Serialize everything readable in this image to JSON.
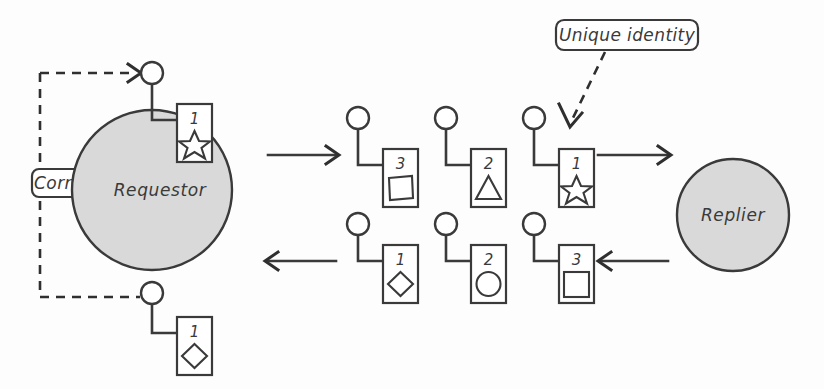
{
  "diagram": {
    "style": {
      "node_fill": "#d9d9d9",
      "stroke": "#3a3a3a",
      "background": "#fdfdfd"
    },
    "nodes": [
      {
        "id": "requestor",
        "label": "Requestor",
        "shape": "circle"
      },
      {
        "id": "replier",
        "label": "Replier",
        "shape": "circle"
      }
    ],
    "callouts": [
      {
        "id": "correlation",
        "label": "Correlation",
        "pointer": "dashed-loop"
      },
      {
        "id": "unique-identity",
        "label": "Unique identity",
        "pointer": "dashed-arrow"
      }
    ],
    "requestor_ports": [
      {
        "id": "requestor-out-port",
        "card_number": "1",
        "glyph": "star"
      },
      {
        "id": "requestor-in-port",
        "card_number": "1",
        "glyph": "diamond"
      }
    ],
    "request_messages": [
      {
        "card_number": "3",
        "glyph": "square"
      },
      {
        "card_number": "2",
        "glyph": "triangle"
      },
      {
        "card_number": "1",
        "glyph": "star"
      }
    ],
    "reply_messages": [
      {
        "card_number": "1",
        "glyph": "diamond"
      },
      {
        "card_number": "2",
        "glyph": "circle"
      },
      {
        "card_number": "3",
        "glyph": "square"
      }
    ],
    "flow": {
      "request_direction": "right",
      "reply_direction": "left"
    }
  }
}
